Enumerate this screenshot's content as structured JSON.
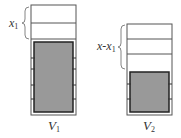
{
  "diagram": {
    "left": {
      "label": "V",
      "subscript": "1",
      "brace_label": "x",
      "brace_subscript": "1",
      "empty_segments": 2,
      "tick_pairs": 4
    },
    "right": {
      "label": "V",
      "subscript": "2",
      "brace_label": "x-x",
      "brace_subscript": "1",
      "empty_segments": 3,
      "tick_pairs": 2
    },
    "colors": {
      "outline": "#555555",
      "fill": "#999999",
      "inner_border": "#222222",
      "background": "#ffffff"
    }
  }
}
